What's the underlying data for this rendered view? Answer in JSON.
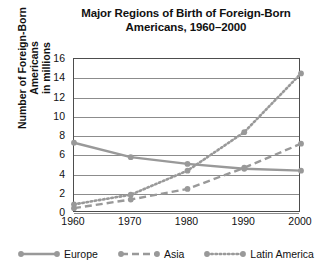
{
  "chart_data": {
    "type": "line",
    "title": "Major Regions of Birth of Foreign-Born Americans, 1960–2000",
    "title_line1": "Major Regions of Birth of Foreign-Born",
    "title_line2": "Americans, 1960–2000",
    "xlabel": "",
    "ylabel": "Number of Foreign-Born Americans in millions",
    "ylabel_line1": "Number of Foreign-Born Americans",
    "ylabel_line2": "in millions",
    "x": [
      1960,
      1970,
      1980,
      1990,
      2000
    ],
    "categories": [
      "1960",
      "1970",
      "1980",
      "1990",
      "2000"
    ],
    "ylim": [
      0,
      16
    ],
    "yticks": [
      0,
      2,
      4,
      6,
      8,
      10,
      12,
      14,
      16
    ],
    "ytick_labels": [
      "0",
      "2",
      "4",
      "6",
      "8",
      "10",
      "12",
      "14",
      "16"
    ],
    "grid": "horizontal",
    "legend_position": "bottom",
    "series": [
      {
        "name": "Europe",
        "style": "solid",
        "color": "#999999",
        "values": [
          7.3,
          5.8,
          5.1,
          4.6,
          4.4
        ]
      },
      {
        "name": "Asia",
        "style": "dashed",
        "color": "#999999",
        "values": [
          0.5,
          1.4,
          2.5,
          4.7,
          7.2
        ]
      },
      {
        "name": "Latin America",
        "style": "dotted",
        "color": "#999999",
        "values": [
          0.9,
          1.9,
          4.4,
          8.4,
          14.5
        ]
      }
    ]
  },
  "legend": {
    "items": [
      {
        "label": "Europe",
        "style": "solid"
      },
      {
        "label": "Asia",
        "style": "dashed"
      },
      {
        "label": "Latin America",
        "style": "dotted"
      }
    ]
  },
  "colors": {
    "series": "#999999",
    "grid": "#8c8c8c",
    "frame": "#4d4d4d",
    "text": "#111111",
    "background": "#ffffff"
  }
}
